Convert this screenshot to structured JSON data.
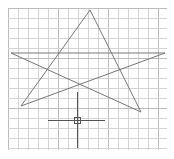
{
  "canvas": {
    "background": "#ffffff",
    "grid": {
      "x0": 8,
      "y0": 8,
      "x1": 167,
      "y1": 150,
      "spacing": 10,
      "minor_color": "#d4d4d4",
      "major_color": "#bdbdbd"
    },
    "star": {
      "color": "#777777",
      "points": [
        [
          90,
          10
        ],
        [
          21,
          106
        ],
        [
          165,
          53
        ],
        [
          11,
          53
        ],
        [
          141,
          112
        ],
        [
          90,
          10
        ]
      ]
    },
    "crosshair": {
      "color": "#555555",
      "center": [
        77,
        120
      ],
      "h_extent": [
        48,
        105
      ],
      "v_extent": [
        92,
        148
      ],
      "pickbox_size": 6
    }
  }
}
